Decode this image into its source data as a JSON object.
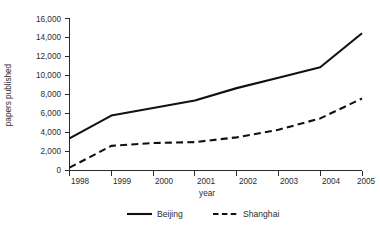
{
  "chart_data": {
    "type": "line",
    "title": "",
    "xlabel": "year",
    "ylabel": "papers published",
    "categories": [
      "1998",
      "1999",
      "2000",
      "2001",
      "2002",
      "2003",
      "2004",
      "2005"
    ],
    "x": [
      1998,
      1999,
      2000,
      2001,
      2002,
      2003,
      2004,
      2005
    ],
    "xlim": [
      1998,
      2005
    ],
    "ylim": [
      0,
      16000
    ],
    "ytick_labels": [
      "0",
      "2,000",
      "4,000",
      "6,000",
      "8,000",
      "10,000",
      "12,000",
      "14,000",
      "16,000"
    ],
    "ytick_values": [
      0,
      2000,
      4000,
      6000,
      8000,
      10000,
      12000,
      14000,
      16000
    ],
    "xtick_labels": [
      "1998",
      "1999",
      "2000",
      "2001",
      "2002",
      "2003",
      "2004",
      "2005"
    ],
    "grid": false,
    "legend_position": "bottom",
    "series": [
      {
        "name": "Beijing",
        "style": "solid",
        "color": "#111111",
        "values": [
          3400,
          5800,
          6600,
          7400,
          8700,
          9800,
          10900,
          14500
        ]
      },
      {
        "name": "Shanghai",
        "style": "dashed",
        "color": "#111111",
        "values": [
          300,
          2600,
          2900,
          3000,
          3500,
          4300,
          5500,
          7600
        ]
      }
    ],
    "legend": [
      {
        "label": "Beijing",
        "style": "solid"
      },
      {
        "label": "Shanghai",
        "style": "dashed"
      }
    ]
  },
  "axis": {
    "y_title": "papers published",
    "x_title": "year",
    "y_labels": {
      "t0": "0",
      "t1": "2,000",
      "t2": "4,000",
      "t3": "6,000",
      "t4": "8,000",
      "t5": "10,000",
      "t6": "12,000",
      "t7": "14,000",
      "t8": "16,000"
    },
    "x_labels": {
      "t0": "1998",
      "t1": "1999",
      "t2": "2000",
      "t3": "2001",
      "t4": "2002",
      "t5": "2003",
      "t6": "2004",
      "t7": "2005"
    }
  },
  "legend": {
    "beijing_label": "Beijing",
    "shanghai_label": "Shanghai"
  }
}
